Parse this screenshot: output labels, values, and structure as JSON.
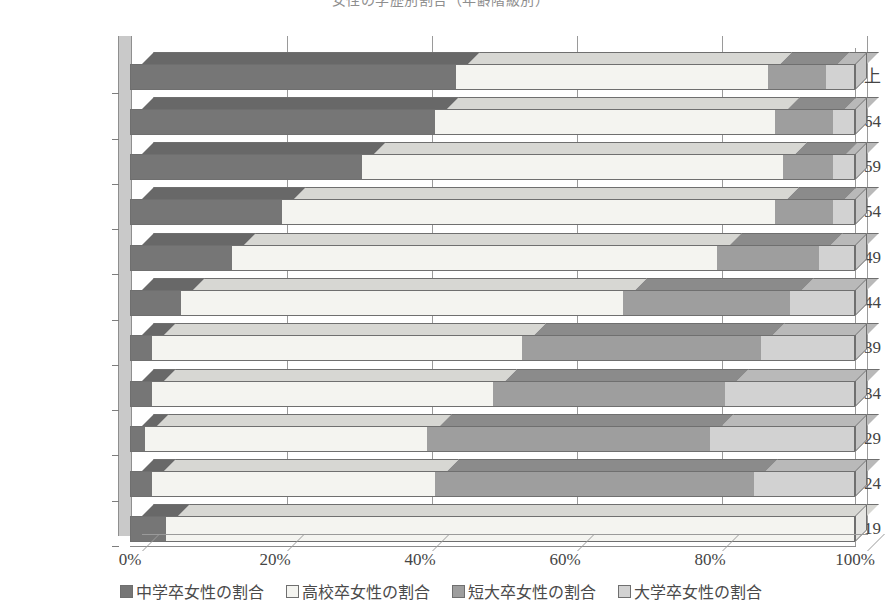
{
  "title": "女性の学歴別割合（年齢階級別）",
  "chart_data": {
    "type": "bar",
    "orientation": "horizontal",
    "stacked": true,
    "stack_mode": "percent",
    "style": "3d-stacked-horizontal-bar",
    "title": "女性の学歴別割合（年齢階級別）",
    "xlabel": "",
    "ylabel": "",
    "xlim": [
      0,
      100
    ],
    "xticks": [
      0,
      20,
      40,
      60,
      80,
      100
    ],
    "xtick_labels": [
      "0%",
      "20%",
      "40%",
      "60%",
      "80%",
      "100%"
    ],
    "grid": true,
    "legend_position": "bottom",
    "categories": [
      "65歳以上",
      "60〜64",
      "55〜59",
      "50〜54",
      "45〜49",
      "40〜44",
      "35〜39",
      "30〜34",
      "25〜29",
      "20〜24",
      "15〜19"
    ],
    "series": [
      {
        "name": "中学卒女性の割合",
        "color": "#767676",
        "values": [
          45,
          42,
          32,
          21,
          14,
          7,
          3,
          3,
          2,
          3,
          5
        ]
      },
      {
        "name": "高校卒女性の割合",
        "color": "#f4f4f0",
        "values": [
          43,
          47,
          58,
          68,
          67,
          61,
          51,
          47,
          39,
          39,
          95
        ]
      },
      {
        "name": "短大卒女性の割合",
        "color": "#9e9e9e",
        "values": [
          8,
          8,
          7,
          8,
          14,
          23,
          33,
          32,
          39,
          44,
          0
        ]
      },
      {
        "name": "大学卒女性の割合",
        "color": "#d2d2d2",
        "values": [
          4,
          3,
          3,
          3,
          5,
          9,
          13,
          18,
          20,
          14,
          0
        ]
      }
    ]
  },
  "legend": {
    "items": [
      {
        "label": "中学卒女性の割合",
        "color": "#767676"
      },
      {
        "label": "高校卒女性の割合",
        "color": "#f4f4f0"
      },
      {
        "label": "短大卒女性の割合",
        "color": "#9e9e9e"
      },
      {
        "label": "大学卒女性の割合",
        "color": "#d2d2d2"
      }
    ]
  }
}
